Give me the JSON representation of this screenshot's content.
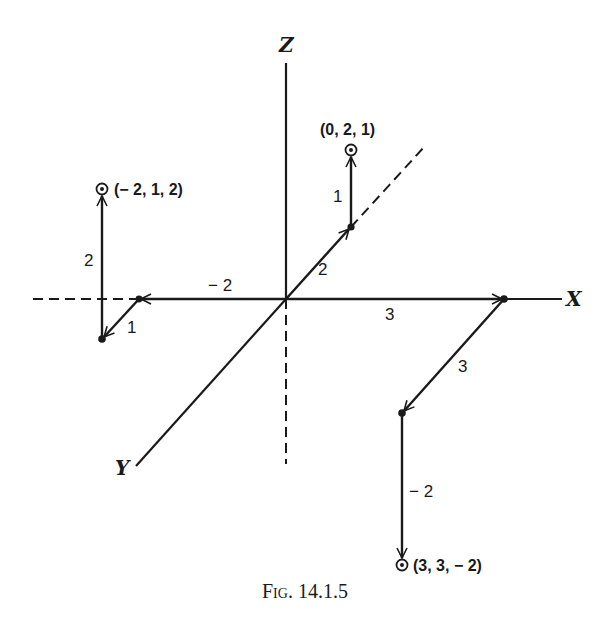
{
  "figure": {
    "caption": "Fig. 14.1.5",
    "axes": {
      "x_label": "X",
      "y_label": "Y",
      "z_label": "Z"
    },
    "points": [
      {
        "label": "(0, 2, 1)",
        "x": 0,
        "y": 2,
        "z": 1
      },
      {
        "label": "(− 2, 1, 2)",
        "x": -2,
        "y": 1,
        "z": 2
      },
      {
        "label": "(3, 3, − 2)",
        "x": 3,
        "y": 3,
        "z": -2
      }
    ],
    "paths": [
      {
        "target": "(0, 2, 1)",
        "steps": [
          {
            "axis": "x",
            "label": "0"
          },
          {
            "axis": "y",
            "label": "2"
          },
          {
            "axis": "z",
            "label": "1"
          }
        ]
      },
      {
        "target": "(− 2, 1, 2)",
        "steps": [
          {
            "axis": "x",
            "label": "− 2"
          },
          {
            "axis": "y",
            "label": "1"
          },
          {
            "axis": "z",
            "label": "2"
          }
        ]
      },
      {
        "target": "(3, 3, − 2)",
        "steps": [
          {
            "axis": "x",
            "label": "3"
          },
          {
            "axis": "y",
            "label": "3"
          },
          {
            "axis": "z",
            "label": "− 2"
          }
        ]
      }
    ],
    "segment_labels": {
      "p1_y": "2",
      "p1_z": "1",
      "p2_x": "− 2",
      "p2_y": "1",
      "p2_z": "2",
      "p3_x": "3",
      "p3_y": "3",
      "p3_z": "− 2"
    },
    "ink_color": "#1a1a1a",
    "background": "#ffffff"
  }
}
